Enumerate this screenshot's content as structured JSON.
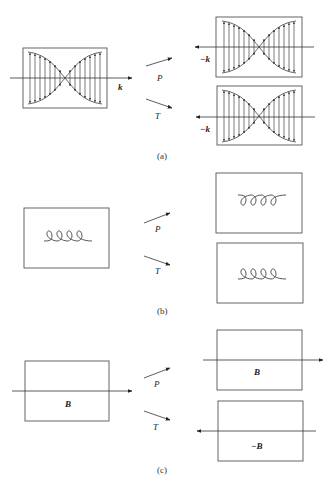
{
  "figure": {
    "panels": [
      {
        "id": "a",
        "caption": "(a)",
        "original": {
          "description": "standing wave packet with vertical field vectors",
          "direction_label": "k"
        },
        "parity": {
          "operator_label": "P",
          "direction_label": "−k"
        },
        "time_reversal": {
          "operator_label": "T",
          "direction_label": "−k"
        }
      },
      {
        "id": "b",
        "caption": "(b)",
        "original": {
          "description": "coil / helix with loops up"
        },
        "parity": {
          "operator_label": "P",
          "description": "coil with loops inverted"
        },
        "time_reversal": {
          "operator_label": "T",
          "description": "coil unchanged"
        }
      },
      {
        "id": "c",
        "caption": "(c)",
        "original": {
          "field_label": "B",
          "arrow_direction": "right"
        },
        "parity": {
          "operator_label": "P",
          "field_label": "B",
          "arrow_direction": "right"
        },
        "time_reversal": {
          "operator_label": "T",
          "field_label": "−B",
          "arrow_direction": "left"
        }
      }
    ],
    "colors": {
      "line": "#222222",
      "box": "#555555",
      "background": "#ffffff"
    }
  }
}
